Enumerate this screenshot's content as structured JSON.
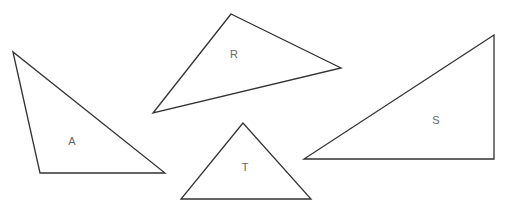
{
  "diagram": {
    "type": "triangles",
    "stroke_color": "#333333",
    "label_color": "#666666",
    "background": "#ffffff",
    "shapes": [
      {
        "label": "A",
        "points": [
          [
            13,
            52
          ],
          [
            40,
            173
          ],
          [
            165,
            173
          ]
        ],
        "label_pos": [
          72,
          142
        ]
      },
      {
        "label": "R",
        "points": [
          [
            231,
            14
          ],
          [
            153,
            113
          ],
          [
            341,
            68
          ]
        ],
        "label_pos": [
          234,
          55
        ]
      },
      {
        "label": "S",
        "points": [
          [
            494,
            35
          ],
          [
            304,
            159
          ],
          [
            494,
            159
          ]
        ],
        "label_pos": [
          436,
          121
        ]
      },
      {
        "label": "T",
        "points": [
          [
            243,
            123
          ],
          [
            181,
            199
          ],
          [
            311,
            199
          ]
        ],
        "label_pos": [
          245,
          168
        ]
      }
    ]
  }
}
